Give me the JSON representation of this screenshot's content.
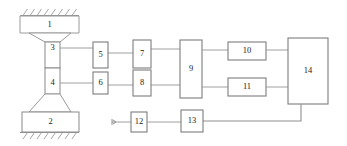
{
  "diagram": {
    "background_color": "#ffffff",
    "line_color": "#9a9a9a",
    "label_color": "#1c1c1c",
    "blocks": [
      {
        "id": "block-1",
        "label": "1",
        "shape": "trapezoid-down",
        "x": 20,
        "y": 16,
        "w": 59,
        "h": 17
      },
      {
        "id": "block-2",
        "label": "2",
        "shape": "rect",
        "x": 22,
        "y": 112,
        "w": 57,
        "h": 20
      },
      {
        "id": "block-3",
        "label": "3",
        "shape": "specimen-upper",
        "x": 45,
        "y": 42,
        "w": 15,
        "h": 26
      },
      {
        "id": "block-4",
        "label": "4",
        "shape": "specimen-lower",
        "x": 45,
        "y": 68,
        "w": 15,
        "h": 26
      },
      {
        "id": "block-5",
        "label": "5",
        "shape": "rect",
        "x": 93,
        "y": 42,
        "w": 15,
        "h": 26
      },
      {
        "id": "block-6",
        "label": "6",
        "shape": "rect",
        "x": 93,
        "y": 72,
        "w": 15,
        "h": 22
      },
      {
        "id": "block-7",
        "label": "7",
        "shape": "rect",
        "x": 133,
        "y": 40,
        "w": 18,
        "h": 28
      },
      {
        "id": "block-8",
        "label": "8",
        "shape": "rect",
        "x": 133,
        "y": 70,
        "w": 18,
        "h": 26
      },
      {
        "id": "block-9",
        "label": "9",
        "shape": "rect",
        "x": 180,
        "y": 40,
        "w": 22,
        "h": 58
      },
      {
        "id": "block-10",
        "label": "10",
        "shape": "rect",
        "x": 228,
        "y": 42,
        "w": 38,
        "h": 18
      },
      {
        "id": "block-11",
        "label": "11",
        "shape": "rect",
        "x": 228,
        "y": 78,
        "w": 38,
        "h": 18
      },
      {
        "id": "block-12",
        "label": "12",
        "shape": "rect",
        "x": 131,
        "y": 112,
        "w": 16,
        "h": 20
      },
      {
        "id": "block-13",
        "label": "13",
        "shape": "rect",
        "x": 181,
        "y": 110,
        "w": 22,
        "h": 22
      },
      {
        "id": "block-14",
        "label": "14",
        "shape": "rect",
        "x": 288,
        "y": 38,
        "w": 40,
        "h": 66
      }
    ],
    "connections": [
      {
        "id": "wire-3-to-5",
        "from": "block-3",
        "to": "block-5"
      },
      {
        "id": "wire-5-to-7",
        "from": "block-5",
        "to": "block-7"
      },
      {
        "id": "wire-7-to-9",
        "from": "block-7",
        "to": "block-9"
      },
      {
        "id": "wire-4-to-6",
        "from": "block-4",
        "to": "block-6"
      },
      {
        "id": "wire-6-to-8",
        "from": "block-6",
        "to": "block-8"
      },
      {
        "id": "wire-8-to-9",
        "from": "block-8",
        "to": "block-9"
      },
      {
        "id": "wire-9-to-10",
        "from": "block-9",
        "to": "block-10"
      },
      {
        "id": "wire-9-to-11",
        "from": "block-9",
        "to": "block-11"
      },
      {
        "id": "wire-10-to-14",
        "from": "block-10",
        "to": "block-14"
      },
      {
        "id": "wire-11-to-14",
        "from": "block-11",
        "to": "block-14"
      },
      {
        "id": "wire-input-12",
        "from": "input-terminal",
        "to": "block-12"
      },
      {
        "id": "wire-12-to-13",
        "from": "block-12",
        "to": "block-13"
      },
      {
        "id": "wire-14-to-13",
        "from": "block-14",
        "to": "block-13"
      }
    ],
    "supports": [
      {
        "id": "support-top",
        "label": "fixed-ground-hatching-top",
        "x": 20,
        "y": 15,
        "w": 59
      },
      {
        "id": "support-bottom",
        "label": "fixed-ground-hatching-bottom",
        "x": 20,
        "y": 133,
        "w": 59
      }
    ],
    "input_terminal": {
      "id": "input-terminal",
      "label": "signal-input-terminal",
      "x": 112,
      "y": 122
    }
  }
}
